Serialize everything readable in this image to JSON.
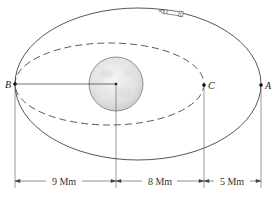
{
  "diagram": {
    "points": {
      "A": {
        "label": "A",
        "x": 261,
        "y": 85
      },
      "B": {
        "label": "B",
        "x": 15,
        "y": 84
      },
      "C": {
        "label": "C",
        "x": 204,
        "y": 85
      }
    },
    "planet": {
      "cx": 116,
      "cy": 84,
      "r": 27,
      "fill": "#e6e6e6",
      "stroke": "#777777"
    },
    "outer_orbit": {
      "style": "solid",
      "cx": 138,
      "cy": 84,
      "rx": 123,
      "ry": 76
    },
    "inner_orbit": {
      "style": "dashed",
      "cx": 109.5,
      "cy": 84,
      "rx": 94.5,
      "ry": 41
    },
    "dimensions": [
      {
        "label": "9 Mm",
        "from": "B",
        "to": "planet-center"
      },
      {
        "label": "8 Mm",
        "from": "planet-center",
        "to": "C"
      },
      {
        "label": "5 Mm",
        "from": "C",
        "to": "A"
      }
    ],
    "rocket": {
      "icon": "rocket-icon",
      "direction": "counterclockwise"
    }
  }
}
